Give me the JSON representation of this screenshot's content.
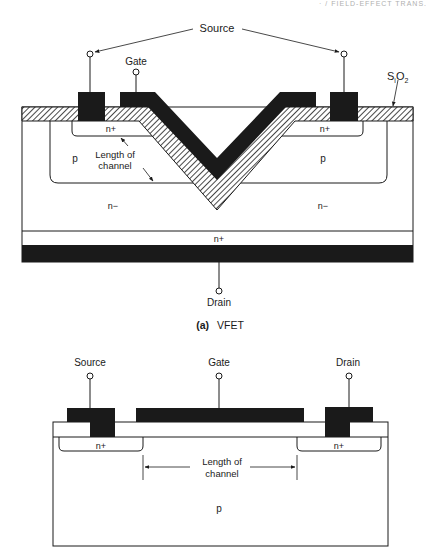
{
  "page_header": "· / FIELD-EFFECT TRANS.",
  "figure_a": {
    "caption_prefix": "(a)",
    "caption": "VFET",
    "labels": {
      "source": "Source",
      "gate": "Gate",
      "sio2_s": "S",
      "sio2_sub1": "i",
      "sio2_o": "O",
      "sio2_sub2": "2",
      "n_plus_left": "n+",
      "n_plus_right": "n+",
      "p_left": "p",
      "p_right": "p",
      "length_line1": "Length of",
      "length_line2": "channel",
      "n_minus_left": "n−",
      "n_minus_right": "n−",
      "n_plus_bottom": "n+",
      "drain": "Drain"
    }
  },
  "figure_b": {
    "labels": {
      "source": "Source",
      "gate": "Gate",
      "drain": "Drain",
      "n_plus_left": "n+",
      "n_plus_right": "n+",
      "length_line1": "Length of",
      "length_line2": "channel",
      "p": "p"
    }
  },
  "colors": {
    "ink": "#1a1a1a",
    "background": "#ffffff"
  }
}
